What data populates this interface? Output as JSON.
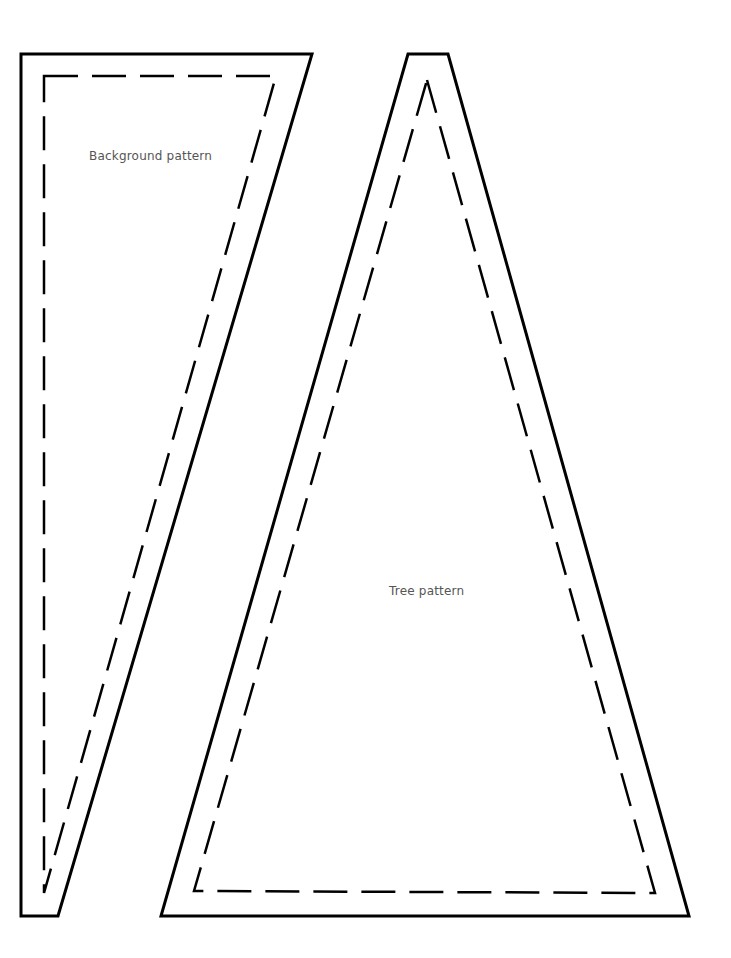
{
  "page": {
    "background": "#ffffff",
    "stroke_color": "#000000",
    "label_color": "#555555"
  },
  "pieces": [
    {
      "id": "background-pattern",
      "label": "Background pattern",
      "outer_points": "21,54 312,54 58,916 21,916",
      "seam_points": "44,76 276,76 44,893"
    },
    {
      "id": "tree-pattern",
      "label": "Tree pattern",
      "outer_points": "408,54 448,54 689,916 161,916",
      "seam_points": "427,80 655,893 194,891"
    }
  ]
}
